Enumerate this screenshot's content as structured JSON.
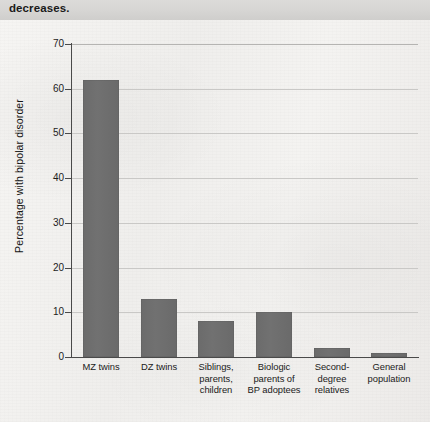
{
  "header": {
    "text": "decreases."
  },
  "chart_data": {
    "type": "bar",
    "title": "",
    "xlabel": "",
    "ylabel": "Percentage with bipolar disorder",
    "categories": [
      "MZ twins",
      "DZ twins",
      "Siblings, parents, children",
      "Biologic parents of BP adoptees",
      "Second-degree relatives",
      "General population"
    ],
    "category_lines": [
      [
        "MZ twins"
      ],
      [
        "DZ twins"
      ],
      [
        "Siblings,",
        "parents,",
        "children"
      ],
      [
        "Biologic",
        "parents of",
        "BP adoptees"
      ],
      [
        "Second-",
        "degree",
        "relatives"
      ],
      [
        "General",
        "population"
      ]
    ],
    "values": [
      62,
      13,
      8,
      10,
      2,
      1
    ],
    "ylim": [
      0,
      70
    ],
    "yticks": [
      0,
      10,
      20,
      30,
      40,
      50,
      60,
      70
    ],
    "grid": true,
    "legend": "none",
    "bar_color": "#6e6e6e",
    "axis_color": "#4a4a4a",
    "grid_color": "#c9c8c6"
  }
}
